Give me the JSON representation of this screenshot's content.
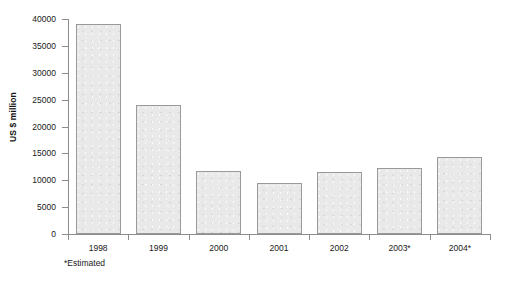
{
  "chart_data": {
    "type": "bar",
    "title": "",
    "subtitle": "",
    "xlabel": "",
    "ylabel": "US $ million",
    "categories": [
      "1998",
      "1999",
      "2000",
      "2001",
      "2002",
      "2003*",
      "2004*"
    ],
    "values": [
      39000,
      24000,
      11800,
      9500,
      11500,
      12300,
      14300
    ],
    "ylim": [
      0,
      40000
    ],
    "ytick_values": [
      0,
      5000,
      10000,
      15000,
      20000,
      25000,
      30000,
      35000,
      40000
    ],
    "ytick_labels": [
      "0",
      "5000",
      "10000",
      "15000",
      "20000",
      "25000",
      "30000",
      "35000",
      "40000"
    ],
    "grid": false,
    "legend": null,
    "annotations": [
      "*Estimated"
    ],
    "bar_fill_color": "#e9e9e9",
    "bar_border_color": "#9a9a9a",
    "axis_color": "#8c8c8c",
    "background_color": "#ffffff"
  },
  "footnote": {
    "text": "*Estimated"
  }
}
